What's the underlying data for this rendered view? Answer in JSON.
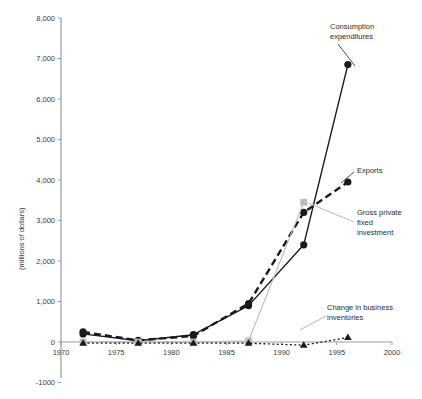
{
  "chart_data": {
    "type": "line",
    "title": "",
    "xlabel": "",
    "ylabel": "(millions of dollars)",
    "xlim": [
      1970,
      2000
    ],
    "ylim": [
      -1000,
      8000
    ],
    "grid": false,
    "legend_position": "inline-annotations",
    "x_ticks": [
      "1970",
      "1975",
      "1980",
      "1985",
      "1990",
      "1995",
      "2000"
    ],
    "x_tick_values": [
      1970,
      1975,
      1980,
      1985,
      1990,
      1995,
      2000
    ],
    "y_ticks": [
      "8,000",
      "7,000",
      "6,000",
      "5,000",
      "4,000",
      "3,000",
      "2,000",
      "1,000",
      "0",
      "-1000"
    ],
    "y_tick_values": [
      8000,
      7000,
      6000,
      5000,
      4000,
      3000,
      2000,
      1000,
      0,
      -1000
    ],
    "x": [
      1972,
      1977,
      1982,
      1987,
      1992,
      1996
    ],
    "series": [
      {
        "name": "Consumption expenditures",
        "values": [
          200,
          30,
          180,
          900,
          2400,
          6850
        ],
        "marker": "circle",
        "line": "solid",
        "color": "#1a1a1a"
      },
      {
        "name": "Exports",
        "values": [
          250,
          40,
          150,
          950,
          3200,
          3950
        ],
        "marker": "circle",
        "line": "dashed",
        "color": "#1a1a1a"
      },
      {
        "name": "Gross private fixed investment",
        "values": [
          0,
          0,
          0,
          30,
          3450,
          null
        ],
        "marker": "square",
        "line": "thin-solid",
        "color": "#bcbcbc"
      },
      {
        "name": "Change in business inventories",
        "values": [
          -30,
          -30,
          -30,
          -30,
          -80,
          110
        ],
        "marker": "triangle",
        "line": "dotted",
        "color": "#1a1a1a"
      }
    ],
    "annotations": [
      {
        "id": "consumption",
        "text": "Consumption\nexpenditures",
        "series": "Consumption expenditures"
      },
      {
        "id": "exports",
        "text": "Exports",
        "series": "Exports"
      },
      {
        "id": "gpfi",
        "text": "Gross private\nfixed\ninvestment",
        "series": "Gross private fixed investment"
      },
      {
        "id": "inventories",
        "text": "Change in business\ninventories",
        "series": "Change in business inventories"
      }
    ]
  },
  "axis": {
    "y_title": "(millions of dollars)"
  }
}
